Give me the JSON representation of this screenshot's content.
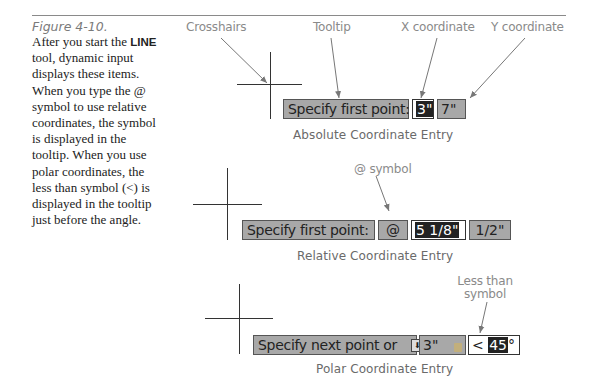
{
  "caption": {
    "figure_label": "Figure 4-10.",
    "body_pre": "After you start the ",
    "body_bold": "LINE",
    "body_post": " tool, dynamic input displays these items. When you type the @ symbol to use relative coordinates, the symbol is displayed in the tooltip. When you use polar coordinates, the less than symbol (<) is displayed in the tooltip just before the angle."
  },
  "callouts": {
    "crosshairs": "Crosshairs",
    "tooltip": "Tooltip",
    "x_coordinate": "X coordinate",
    "y_coordinate": "Y coordinate",
    "at_symbol": "@ symbol",
    "less_than_line1": "Less than",
    "less_than_line2": "symbol"
  },
  "absolute": {
    "tooltip": "Specify first point:",
    "x_value": "3\"",
    "y_value": "7\"",
    "title": "Absolute Coordinate Entry"
  },
  "relative": {
    "tooltip": "Specify first point:",
    "at": "@",
    "x_value": "5 1/8\"",
    "y_value": "1/2\"",
    "title": "Relative Coordinate Entry"
  },
  "polar": {
    "tooltip": "Specify next point or",
    "options_icon": "down-arrow-icon",
    "distance": "3\"",
    "lock_icon": "lock-icon",
    "less_than": "<",
    "angle": "45",
    "degree": "°",
    "title": "Polar Coordinate Entry"
  }
}
